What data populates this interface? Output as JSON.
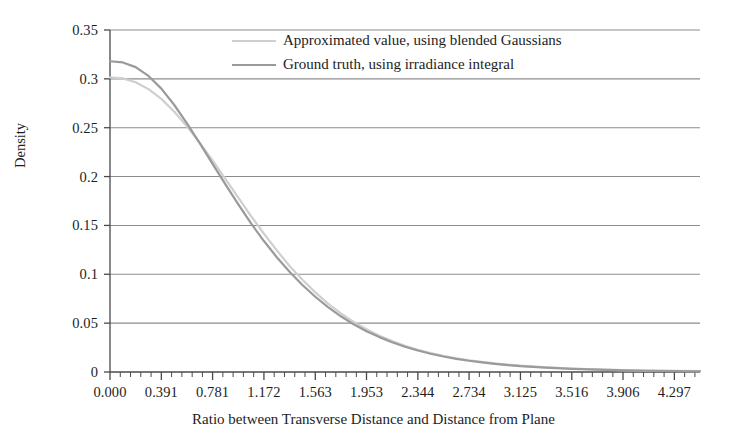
{
  "chart_data": {
    "type": "line",
    "title": "",
    "xlabel": "Ratio between Transverse Distance and Distance from Plane",
    "ylabel": "Density",
    "xlim": [
      0.0,
      4.4922
    ],
    "ylim": [
      0.0,
      0.35
    ],
    "grid": "horizontal",
    "legend_position": "top-center",
    "xticks": [
      "0.000",
      "0.391",
      "0.781",
      "1.172",
      "1.563",
      "1.953",
      "2.344",
      "2.734",
      "3.125",
      "3.516",
      "3.906",
      "4.297"
    ],
    "xtick_values": [
      0.0,
      0.391,
      0.781,
      1.172,
      1.563,
      1.953,
      2.344,
      2.734,
      3.125,
      3.516,
      3.906,
      4.297
    ],
    "yticks": [
      "0",
      "0.05",
      "0.1",
      "0.15",
      "0.2",
      "0.25",
      "0.3",
      "0.35"
    ],
    "ytick_values": [
      0.0,
      0.05,
      0.1,
      0.15,
      0.2,
      0.25,
      0.3,
      0.35
    ],
    "x_minor_ticks_per_interval": 4,
    "series": [
      {
        "name": "Approximated value, using blended Gaussians",
        "color": "#cfcfcf",
        "linewidth": 2.2,
        "x": [
          0.0,
          0.098,
          0.195,
          0.293,
          0.391,
          0.488,
          0.586,
          0.684,
          0.781,
          0.879,
          0.977,
          1.074,
          1.172,
          1.27,
          1.367,
          1.465,
          1.563,
          1.66,
          1.758,
          1.855,
          1.953,
          2.051,
          2.148,
          2.246,
          2.344,
          2.441,
          2.539,
          2.637,
          2.734,
          2.832,
          2.93,
          3.027,
          3.125,
          3.32,
          3.516,
          3.711,
          3.906,
          4.102,
          4.297,
          4.492
        ],
        "y": [
          0.3015,
          0.3005,
          0.2965,
          0.2895,
          0.2795,
          0.2665,
          0.2515,
          0.2345,
          0.2165,
          0.1975,
          0.1785,
          0.1595,
          0.1415,
          0.1245,
          0.1085,
          0.0945,
          0.0815,
          0.07,
          0.06,
          0.0512,
          0.0437,
          0.0372,
          0.0316,
          0.0268,
          0.0228,
          0.0194,
          0.0165,
          0.0141,
          0.012,
          0.0103,
          0.0088,
          0.0076,
          0.0065,
          0.0048,
          0.0036,
          0.0027,
          0.002,
          0.0015,
          0.0011,
          0.0008
        ]
      },
      {
        "name": "Ground truth, using irradiance integral",
        "color": "#9a9a9a",
        "linewidth": 2.2,
        "x": [
          0.0,
          0.098,
          0.195,
          0.293,
          0.391,
          0.488,
          0.586,
          0.684,
          0.781,
          0.879,
          0.977,
          1.074,
          1.172,
          1.27,
          1.367,
          1.465,
          1.563,
          1.66,
          1.758,
          1.855,
          1.953,
          2.051,
          2.148,
          2.246,
          2.344,
          2.441,
          2.539,
          2.637,
          2.734,
          2.832,
          2.93,
          3.027,
          3.125,
          3.32,
          3.516,
          3.711,
          3.906,
          4.102,
          4.297,
          4.492
        ],
        "y": [
          0.318,
          0.3168,
          0.312,
          0.303,
          0.29,
          0.2735,
          0.2545,
          0.234,
          0.213,
          0.192,
          0.1715,
          0.152,
          0.134,
          0.1175,
          0.1025,
          0.089,
          0.077,
          0.0663,
          0.057,
          0.0488,
          0.0418,
          0.0357,
          0.0304,
          0.0259,
          0.022,
          0.0187,
          0.0159,
          0.0135,
          0.0115,
          0.0098,
          0.0083,
          0.0071,
          0.006,
          0.0044,
          0.0032,
          0.0024,
          0.0017,
          0.0013,
          0.0009,
          0.0007
        ]
      }
    ]
  },
  "legend": {
    "items": [
      {
        "label": "Approximated value, using blended Gaussians",
        "color": "#cfcfcf"
      },
      {
        "label": "Ground truth, using irradiance integral",
        "color": "#9a9a9a"
      }
    ]
  },
  "axes": {
    "x_title": "Ratio between Transverse Distance and Distance from Plane",
    "y_title": "Density"
  },
  "style": {
    "gridline_color": "#8c8c8c",
    "axis_color": "#4a4a4a",
    "text_color": "#1d1d1d",
    "background": "#ffffff"
  }
}
